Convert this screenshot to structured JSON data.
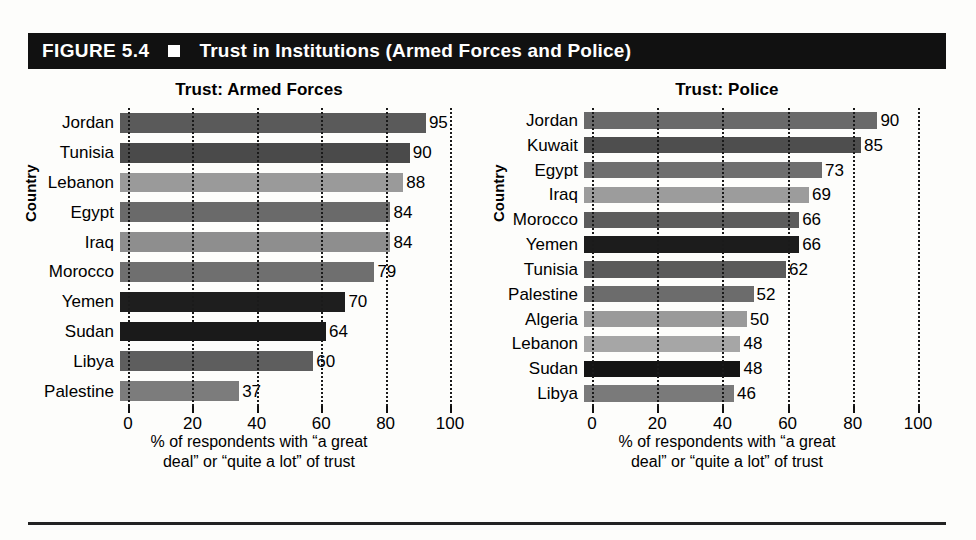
{
  "figure": {
    "number_label": "FIGURE 5.4",
    "bullet_icon": "filled-square",
    "title": "Trust in Institutions (Armed Forces and Police)"
  },
  "axis": {
    "y_title": "Country",
    "x_title_line1": "% of respondents with “a great",
    "x_title_line2": "deal” or “quite a lot” of trust",
    "ticks": [
      "0",
      "20",
      "40",
      "60",
      "80",
      "100"
    ]
  },
  "chart_data": [
    {
      "type": "bar",
      "orientation": "horizontal",
      "title": "Trust: Armed Forces",
      "xlabel": "% of respondents with “a great deal” or “quite a lot” of trust",
      "ylabel": "Country",
      "xlim": [
        0,
        100
      ],
      "xticks": [
        0,
        20,
        40,
        60,
        80,
        100
      ],
      "grid": "vertical-dotted",
      "legend": "none",
      "categories": [
        "Jordan",
        "Tunisia",
        "Lebanon",
        "Egypt",
        "Iraq",
        "Morocco",
        "Yemen",
        "Sudan",
        "Libya",
        "Palestine"
      ],
      "values": [
        95,
        90,
        88,
        84,
        84,
        79,
        70,
        64,
        60,
        37
      ],
      "bar_colors": [
        "#5a5a5a",
        "#4a4a4a",
        "#9a9a9a",
        "#6a6a6a",
        "#8e8e8e",
        "#6f6f6f",
        "#1e1e1e",
        "#1a1a1a",
        "#5e5e5e",
        "#7c7c7c"
      ]
    },
    {
      "type": "bar",
      "orientation": "horizontal",
      "title": "Trust: Police",
      "xlabel": "% of respondents with “a great deal” or “quite a lot” of trust",
      "ylabel": "Country",
      "xlim": [
        0,
        100
      ],
      "xticks": [
        0,
        20,
        40,
        60,
        80,
        100
      ],
      "grid": "vertical-dotted",
      "legend": "none",
      "categories": [
        "Jordan",
        "Kuwait",
        "Egypt",
        "Iraq",
        "Morocco",
        "Yemen",
        "Tunisia",
        "Palestine",
        "Algeria",
        "Lebanon",
        "Sudan",
        "Libya"
      ],
      "values": [
        90,
        85,
        73,
        69,
        66,
        66,
        62,
        52,
        50,
        48,
        48,
        46
      ],
      "bar_colors": [
        "#6a6a6a",
        "#4e4e4e",
        "#6e6e6e",
        "#9c9c9c",
        "#5c5c5c",
        "#1c1c1c",
        "#5a5a5a",
        "#6c6c6c",
        "#9a9a9a",
        "#a6a6a6",
        "#141414",
        "#7a7a7a"
      ]
    }
  ]
}
